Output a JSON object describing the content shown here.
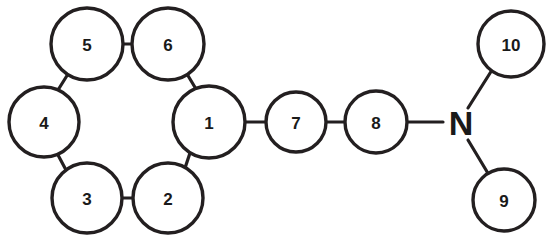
{
  "diagram": {
    "type": "molecular-graph",
    "background_color": "#ffffff",
    "stroke_color": "#231f20",
    "label_color": "#1a1a1a",
    "width": 552,
    "height": 241,
    "nodes": [
      {
        "id": "n1",
        "label": "1",
        "shape": "circle",
        "cx": 209,
        "cy": 122,
        "r": 36,
        "font_size": 17
      },
      {
        "id": "n2",
        "label": "2",
        "shape": "circle",
        "cx": 168,
        "cy": 198,
        "r": 35,
        "font_size": 17
      },
      {
        "id": "n3",
        "label": "3",
        "shape": "circle",
        "cx": 87,
        "cy": 198,
        "r": 35,
        "font_size": 17
      },
      {
        "id": "n4",
        "label": "4",
        "shape": "circle",
        "cx": 44,
        "cy": 122,
        "r": 35,
        "font_size": 17
      },
      {
        "id": "n5",
        "label": "5",
        "shape": "circle",
        "cx": 87,
        "cy": 44,
        "r": 36,
        "font_size": 17
      },
      {
        "id": "n6",
        "label": "6",
        "shape": "circle",
        "cx": 168,
        "cy": 44,
        "r": 36,
        "font_size": 17
      },
      {
        "id": "n7",
        "label": "7",
        "shape": "circle",
        "cx": 296,
        "cy": 122,
        "r": 30,
        "font_size": 17
      },
      {
        "id": "n8",
        "label": "8",
        "shape": "circle",
        "cx": 376,
        "cy": 122,
        "r": 31,
        "font_size": 17
      },
      {
        "id": "n9",
        "label": "9",
        "shape": "circle",
        "cx": 504,
        "cy": 200,
        "r": 31,
        "font_size": 17
      },
      {
        "id": "n10",
        "label": "10",
        "shape": "circle",
        "cx": 511,
        "cy": 44,
        "r": 33,
        "font_size": 17
      },
      {
        "id": "nN",
        "label": "N",
        "shape": "text",
        "cx": 461,
        "cy": 122,
        "r": 18,
        "font_size": 34
      }
    ],
    "edges": [
      {
        "id": "e1-2",
        "from": "n1",
        "to": "n2",
        "x1": 190,
        "y1": 153,
        "x2": 185,
        "y2": 168
      },
      {
        "id": "e2-3",
        "from": "n2",
        "to": "n3",
        "x1": 133,
        "y1": 198,
        "x2": 122,
        "y2": 198
      },
      {
        "id": "e3-4",
        "from": "n3",
        "to": "n4",
        "x1": 66,
        "y1": 170,
        "x2": 58,
        "y2": 155
      },
      {
        "id": "e4-5",
        "from": "n4",
        "to": "n5",
        "x1": 58,
        "y1": 90,
        "x2": 68,
        "y2": 74
      },
      {
        "id": "e5-6",
        "from": "n5",
        "to": "n6",
        "x1": 123,
        "y1": 44,
        "x2": 132,
        "y2": 44
      },
      {
        "id": "e6-1",
        "from": "n6",
        "to": "n1",
        "x1": 187,
        "y1": 74,
        "x2": 196,
        "y2": 89
      },
      {
        "id": "e1-7",
        "from": "n1",
        "to": "n7",
        "x1": 245,
        "y1": 122,
        "x2": 266,
        "y2": 122
      },
      {
        "id": "e7-8",
        "from": "n7",
        "to": "n8",
        "x1": 326,
        "y1": 122,
        "x2": 345,
        "y2": 122
      },
      {
        "id": "e8-N",
        "from": "n8",
        "to": "nN",
        "x1": 407,
        "y1": 122,
        "x2": 443,
        "y2": 122
      },
      {
        "id": "eN-10",
        "from": "nN",
        "to": "n10",
        "x1": 468,
        "y1": 108,
        "x2": 492,
        "y2": 70
      },
      {
        "id": "eN-9",
        "from": "nN",
        "to": "n9",
        "x1": 468,
        "y1": 140,
        "x2": 489,
        "y2": 175
      }
    ]
  }
}
